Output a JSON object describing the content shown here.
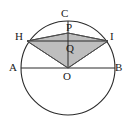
{
  "figure": {
    "type": "geometry-diagram",
    "caption": "",
    "canvas": {
      "width": 131,
      "height": 122
    },
    "colors": {
      "stroke": "#2b2b2b",
      "shade_fill": "#b3b3b3",
      "shade_stroke": "#4d4d4d",
      "background": "#ffffff",
      "label": "#1a1a1a"
    },
    "circle": {
      "name": "main-circle",
      "center": {
        "x": 68,
        "y": 68
      },
      "radius": 47
    },
    "points": [
      {
        "id": "A",
        "label": "A",
        "x": 21,
        "y": 68,
        "label_x": 9,
        "label_y": 62
      },
      {
        "id": "B",
        "label": "B",
        "x": 115,
        "y": 68,
        "label_x": 115,
        "label_y": 62
      },
      {
        "id": "C",
        "label": "C",
        "x": 68,
        "y": 21,
        "label_x": 61,
        "label_y": 8
      },
      {
        "id": "H",
        "label": "H",
        "x": 27,
        "y": 41,
        "label_x": 15,
        "label_y": 31
      },
      {
        "id": "I",
        "label": "I",
        "x": 108,
        "y": 41,
        "label_x": 110,
        "label_y": 31
      },
      {
        "id": "O",
        "label": "O",
        "x": 68,
        "y": 68,
        "label_x": 63,
        "label_y": 71
      },
      {
        "id": "P",
        "label": "P",
        "x": 68,
        "y": 33,
        "label_x": 66,
        "label_y": 22
      },
      {
        "id": "Q",
        "label": "Q",
        "x": 68,
        "y": 51,
        "label_x": 66,
        "label_y": 43
      }
    ],
    "segments": [
      {
        "name": "segment-AB",
        "from": "A",
        "to": "B"
      },
      {
        "name": "segment-CO",
        "from": "C",
        "to": "O"
      },
      {
        "name": "segment-HI",
        "from": "H",
        "to": "I"
      }
    ],
    "shaded_region": {
      "name": "quadrilateral-HPIO",
      "vertices": [
        "H",
        "P",
        "I",
        "O"
      ],
      "points_attr": "27,41 68,33 108,41 68,68"
    }
  }
}
